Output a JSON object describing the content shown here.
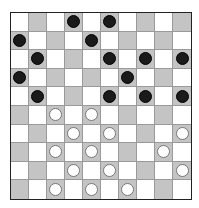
{
  "board": {
    "size": 10,
    "colors": {
      "light": "#ffffff",
      "dark": "#c4c4c4",
      "black_piece": "#1a1a1a",
      "white_piece": "#ffffff"
    },
    "dark_square_rule": "(row + col) odd",
    "pieces": {
      "black": [
        [
          0,
          3
        ],
        [
          0,
          5
        ],
        [
          1,
          0
        ],
        [
          1,
          4
        ],
        [
          2,
          1
        ],
        [
          2,
          5
        ],
        [
          2,
          7
        ],
        [
          2,
          9
        ],
        [
          3,
          0
        ],
        [
          3,
          6
        ],
        [
          4,
          1
        ],
        [
          4,
          5
        ],
        [
          4,
          7
        ],
        [
          4,
          9
        ]
      ],
      "white": [
        [
          5,
          2
        ],
        [
          5,
          4
        ],
        [
          6,
          3
        ],
        [
          6,
          5
        ],
        [
          6,
          9
        ],
        [
          7,
          2
        ],
        [
          7,
          4
        ],
        [
          7,
          8
        ],
        [
          8,
          3
        ],
        [
          8,
          5
        ],
        [
          8,
          9
        ],
        [
          9,
          2
        ],
        [
          9,
          4
        ],
        [
          9,
          6
        ]
      ]
    }
  }
}
